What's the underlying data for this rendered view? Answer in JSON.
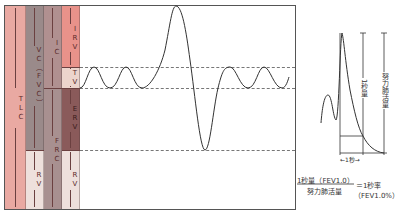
{
  "spirogram": {
    "columns": {
      "tlc": {
        "label": "TLC",
        "color": "#e9a9a2"
      },
      "vc": {
        "label": "VC（FVC）",
        "color": "#9a8a8a"
      },
      "ic": {
        "label": "IC",
        "color": "#b09090"
      },
      "frc": {
        "label": "FRC",
        "color": "#a89090"
      },
      "irv": {
        "label": "IRV",
        "color": "#e8928a"
      },
      "tv": {
        "label": "TV",
        "color": "#ecd4cc"
      },
      "erv": {
        "label": "ERV",
        "color": "#8a5a5a"
      },
      "rv_vc": {
        "label": "RV",
        "color": "#eee0dc"
      },
      "rv_right": {
        "label": "RV",
        "color": "#eee0dc"
      }
    }
  },
  "fev_panel": {
    "fev1_label": "1秒量",
    "fvc_label": "努力肺活量",
    "time_label": "←1秒→"
  },
  "formula": {
    "numerator": "1秒量（FEV1.0）",
    "denominator": "努力肺活量",
    "equals": "＝1秒率",
    "result": "（FEV1.0%）"
  }
}
